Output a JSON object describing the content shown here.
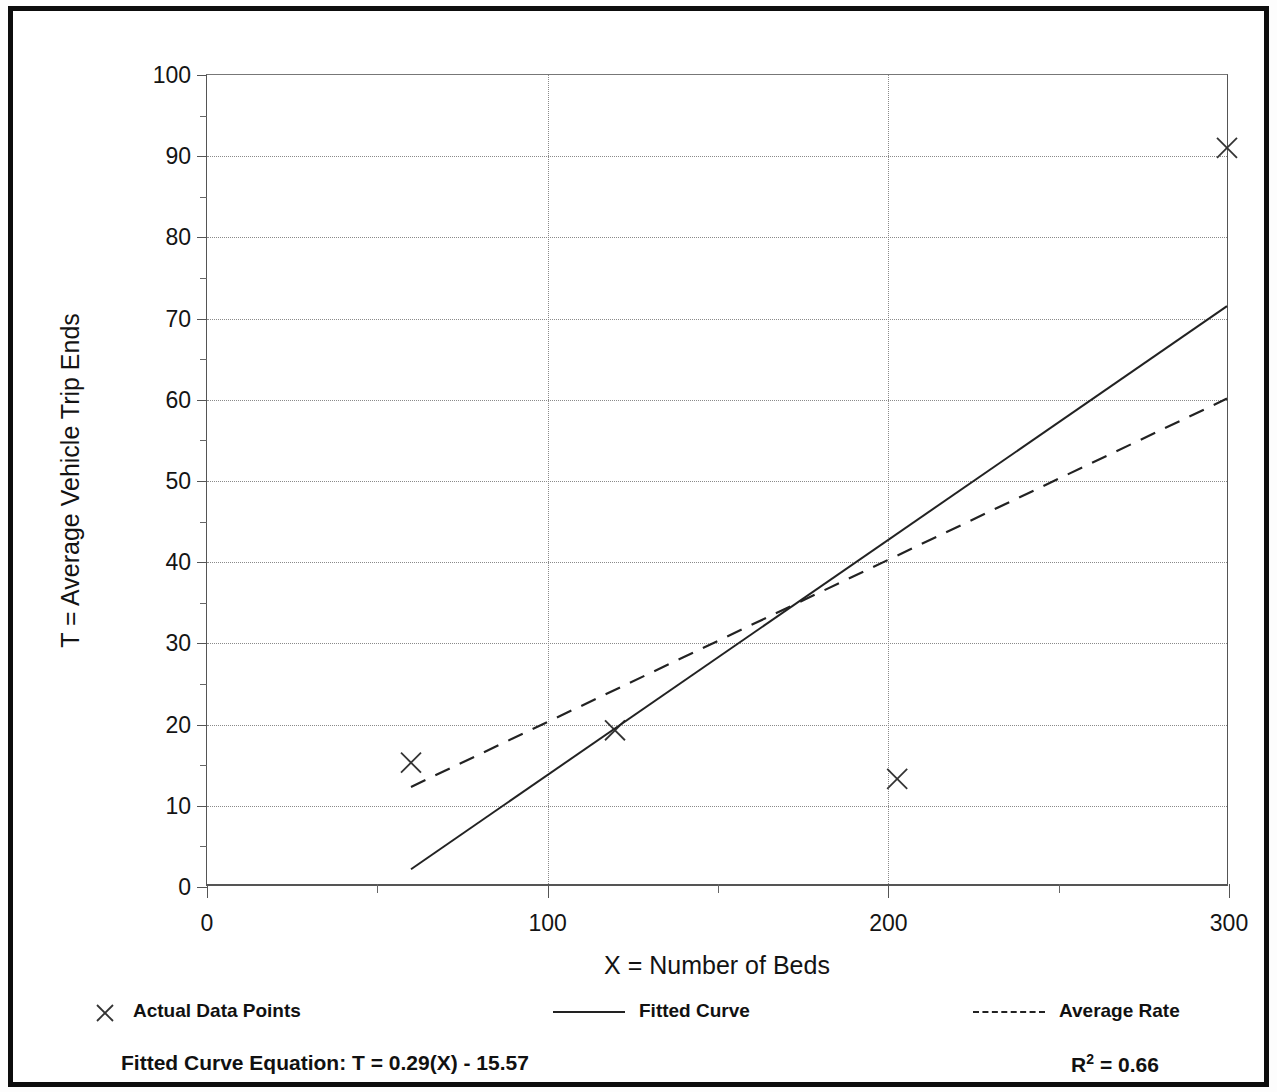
{
  "chart_data": {
    "type": "scatter",
    "title": "",
    "xlabel": "X = Number of Beds",
    "ylabel": "T = Average Vehicle Trip Ends",
    "xlim": [
      0,
      300
    ],
    "ylim": [
      0,
      100
    ],
    "x_ticks": [
      0,
      100,
      200,
      300
    ],
    "x_tick_labels": [
      "0",
      "100",
      "200",
      "300"
    ],
    "x_minor_ticks": [
      50,
      150,
      250
    ],
    "y_ticks": [
      0,
      10,
      20,
      30,
      40,
      50,
      60,
      70,
      80,
      90,
      100
    ],
    "y_tick_labels": [
      "0",
      "10",
      "20",
      "30",
      "40",
      "50",
      "60",
      "70",
      "80",
      "90",
      "100"
    ],
    "y_minor_ticks": [
      5,
      15,
      25,
      35,
      45,
      55,
      65,
      75,
      85,
      95
    ],
    "grid": "dotted major gridlines on both axes",
    "legend_position": "below-plot",
    "series": [
      {
        "name": "Actual Data Points",
        "type": "scatter",
        "marker": "x",
        "points": [
          {
            "x": 60,
            "y": 15
          },
          {
            "x": 120,
            "y": 19
          },
          {
            "x": 203,
            "y": 13
          },
          {
            "x": 300,
            "y": 91
          }
        ]
      },
      {
        "name": "Fitted Curve",
        "type": "line",
        "style": "solid",
        "equation": "T = 0.29(X) - 15.57",
        "slope": 0.29,
        "intercept": -15.57,
        "points": [
          {
            "x": 60,
            "y": 1.83
          },
          {
            "x": 300,
            "y": 71.43
          }
        ]
      },
      {
        "name": "Average Rate",
        "type": "line",
        "style": "dashed",
        "slope": 0.2,
        "intercept": 0,
        "points": [
          {
            "x": 60,
            "y": 12.0
          },
          {
            "x": 300,
            "y": 60.0
          }
        ]
      }
    ]
  },
  "legend": {
    "items": [
      {
        "label": "Actual Data Points",
        "marker": "x-marker"
      },
      {
        "label": "Fitted Curve",
        "marker": "solid-line"
      },
      {
        "label": "Average Rate",
        "marker": "dashed-line"
      }
    ]
  },
  "footer": {
    "equation": "Fitted Curve Equation:  T = 0.29(X) - 15.57",
    "r2_prefix": "R",
    "r2_exponent": "2",
    "r2_value": " = 0.66"
  },
  "colors": {
    "frame": "#0d0d0d",
    "axis": "#555555",
    "grid": "#8a8a8a",
    "series": "#222222",
    "text": "#111111",
    "background": "#ffffff"
  }
}
